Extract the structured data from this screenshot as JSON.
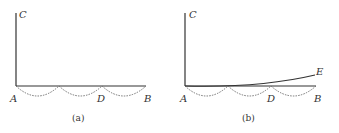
{
  "panels": [
    {
      "id": "a",
      "caption": "(a)",
      "labels": {
        "A": "A",
        "B": "B",
        "C": "C",
        "D": "D"
      }
    },
    {
      "id": "b",
      "caption": "(b)",
      "labels": {
        "A": "A",
        "B": "B",
        "C": "C",
        "D": "D",
        "E": "E"
      }
    }
  ],
  "colors": {
    "line": "#333333",
    "dashed": "#666666"
  }
}
